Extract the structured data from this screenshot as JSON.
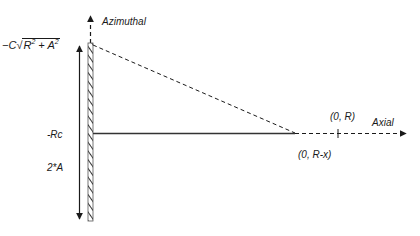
{
  "axes": {
    "vertical_label": "Azimuthal",
    "horizontal_label": "Axial"
  },
  "left_labels": {
    "top_formula": {
      "prefix": "−C",
      "radical": "√",
      "term1": "R",
      "exp1": "2",
      "plus": " + ",
      "term2": "A",
      "exp2": "2"
    },
    "rc": "-Rc",
    "two_a": "2*A"
  },
  "points": {
    "r": "(0, R)",
    "r_minus_x": "(0, R-x)"
  },
  "colors": {
    "line": "#1a1a1a",
    "wall_hatch": "#333333"
  }
}
